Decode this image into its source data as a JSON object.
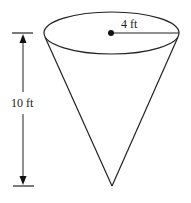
{
  "figure": {
    "type": "cone-diagram",
    "radius_label": "4 ft",
    "height_label": "10 ft",
    "stroke_color": "#222222",
    "background": "#ffffff"
  }
}
